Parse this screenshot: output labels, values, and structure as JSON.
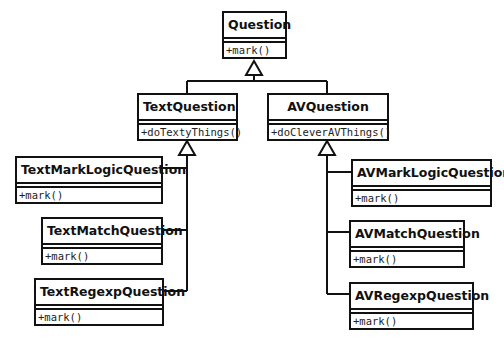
{
  "diagram": {
    "type": "uml-class-diagram",
    "classes": [
      {
        "id": "question",
        "name": "Question",
        "operations": [
          "+mark()"
        ]
      },
      {
        "id": "text-question",
        "name": "TextQuestion",
        "operations": [
          "+doTextyThings()"
        ]
      },
      {
        "id": "av-question",
        "name": "AVQuestion",
        "operations": [
          "+doCleverAVThings()"
        ]
      },
      {
        "id": "text-mark-logic-question",
        "name": "TextMarkLogicQuestion",
        "operations": [
          "+mark()"
        ]
      },
      {
        "id": "text-match-question",
        "name": "TextMatchQuestion",
        "operations": [
          "+mark()"
        ]
      },
      {
        "id": "text-regexp-question",
        "name": "TextRegexpQuestion",
        "operations": [
          "+mark()"
        ]
      },
      {
        "id": "av-mark-logic-question",
        "name": "AVMarkLogicQuestion",
        "operations": [
          "+mark()"
        ]
      },
      {
        "id": "av-match-question",
        "name": "AVMatchQuestion",
        "operations": [
          "+mark()"
        ]
      },
      {
        "id": "av-regexp-question",
        "name": "AVRegexpQuestion",
        "operations": [
          "+mark()"
        ]
      }
    ],
    "generalizations": [
      {
        "child": "TextQuestion",
        "parent": "Question"
      },
      {
        "child": "AVQuestion",
        "parent": "Question"
      },
      {
        "child": "TextMarkLogicQuestion",
        "parent": "TextQuestion"
      },
      {
        "child": "TextMatchQuestion",
        "parent": "TextQuestion"
      },
      {
        "child": "TextRegexpQuestion",
        "parent": "TextQuestion"
      },
      {
        "child": "AVMarkLogicQuestion",
        "parent": "AVQuestion"
      },
      {
        "child": "AVMatchQuestion",
        "parent": "AVQuestion"
      },
      {
        "child": "AVRegexpQuestion",
        "parent": "AVQuestion"
      }
    ],
    "colors": {
      "line": "#111111",
      "background": "#ffffff",
      "text": "#111111"
    }
  }
}
